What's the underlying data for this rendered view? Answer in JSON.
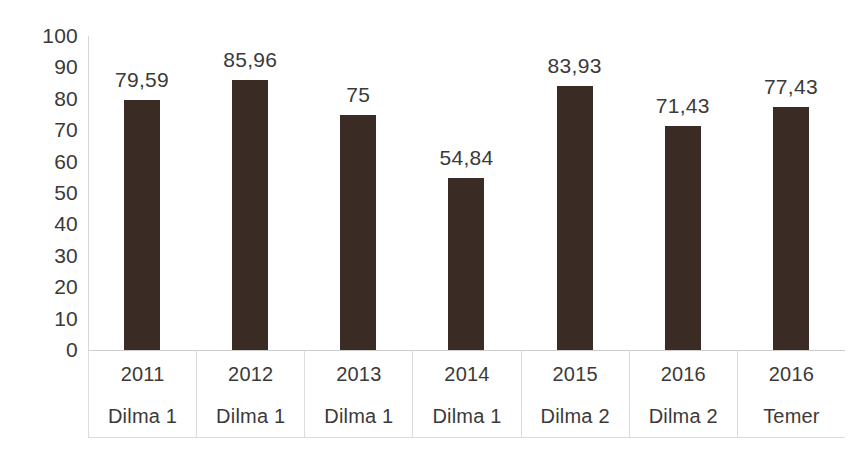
{
  "chart_data": {
    "type": "bar",
    "title": "",
    "subtitle": "",
    "xlabel": "",
    "ylabel": "",
    "categories": [
      "2011",
      "2012",
      "2013",
      "2014",
      "2015",
      "2016",
      "2016"
    ],
    "group_labels": [
      "Dilma 1",
      "Dilma 1",
      "Dilma 1",
      "Dilma 1",
      "Dilma 2",
      "Dilma 2",
      "Temer"
    ],
    "values": [
      79.59,
      85.96,
      75,
      54.84,
      83.93,
      71.43,
      77.43
    ],
    "value_labels": [
      "79,59",
      "85,96",
      "75",
      "54,84",
      "83,93",
      "71,43",
      "77,43"
    ],
    "ylim": [
      0,
      100
    ],
    "ytick_labels": [
      "100",
      "90",
      "80",
      "70",
      "60",
      "50",
      "40",
      "30",
      "20",
      "10",
      "0"
    ],
    "ytick_values": [
      100,
      90,
      80,
      70,
      60,
      50,
      40,
      30,
      20,
      10,
      0
    ],
    "grid": false,
    "legend": "none",
    "bar_color": "#3a2b24",
    "label_color": "#3b3a38",
    "axis_color": "#d8d6d4",
    "background": "#ffffff"
  }
}
